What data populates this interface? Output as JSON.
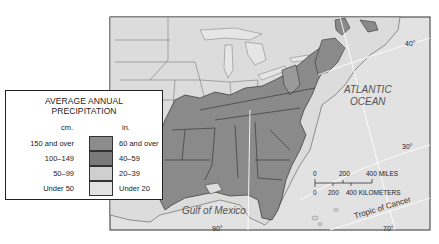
{
  "map": {
    "title": "Average Annual Precipitation — Eastern United States",
    "colors": {
      "background": "#ffffff",
      "land_base": "#dcdcdc",
      "ocean": "#e2e2e2",
      "band_60_over": "#8a8a8a",
      "band_40_59": "#7d7d7d",
      "band_20_39": "#d0d0d0",
      "band_under_20": "#e0e0e0",
      "border": "#333333",
      "graticule": "#ffffff"
    },
    "labels": {
      "ocean": [
        "ATLANTIC",
        "OCEAN"
      ],
      "gulf": "Gulf  of Mexico",
      "tropic": "Tropic  of  Cancer"
    },
    "graticule": {
      "lat_40": "40°",
      "lat_30": "30°",
      "lon_90": "90°",
      "lon_70": "70°"
    },
    "scale_bar": {
      "miles_ticks": [
        "0",
        "200",
        "400 MILES"
      ],
      "km_ticks": [
        "0",
        "200",
        "400 KILOMETERS"
      ]
    }
  },
  "legend": {
    "title_line1": "AVERAGE ANNUAL",
    "title_line2": "PRECIPITATION",
    "unit_cm": "cm.",
    "unit_in": "in.",
    "rows": [
      {
        "cm": "150 and over",
        "in": "60 and over",
        "color": "#8c8c8c"
      },
      {
        "cm": "100–149",
        "in": "40–59",
        "color": "#7a7a7a"
      },
      {
        "cm": "50–99",
        "in": "20–39",
        "color": "#cfcfcf"
      },
      {
        "cm": "Under 50",
        "in": "Under 20",
        "color": "#e1e1e1"
      }
    ]
  }
}
